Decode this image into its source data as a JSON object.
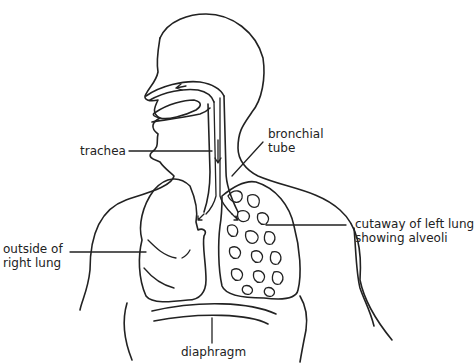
{
  "diagram": {
    "labels": {
      "trachea": "trachea",
      "bronchial_tube_line1": "bronchial",
      "bronchial_tube_line2": "tube",
      "left_lung_line1": "cutaway of left lung",
      "left_lung_line2": "showing alveoli",
      "right_lung_line1": "outside of",
      "right_lung_line2": "right lung",
      "diaphragm": "diaphragm"
    },
    "colors": {
      "stroke": "#222222",
      "background": "#ffffff"
    }
  }
}
